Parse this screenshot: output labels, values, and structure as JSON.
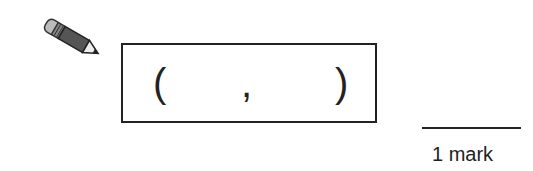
{
  "answer": {
    "open_paren": "(",
    "separator": ",",
    "close_paren": ")"
  },
  "marks": {
    "label": "1 mark"
  },
  "icons": {
    "pencil": "pencil-icon"
  }
}
